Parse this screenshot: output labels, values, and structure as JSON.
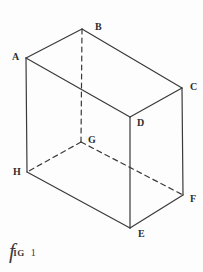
{
  "figure": {
    "caption": {
      "lead": "f",
      "small_caps": "IG",
      "number": "1",
      "full_text": "Fig 1"
    },
    "style": {
      "background_color": "#fdfdfd",
      "stroke_color": "#3a3a3a",
      "label_color": "#2e2e2e",
      "stroke_width": 1.2,
      "hidden_dash_pattern": "5 4"
    },
    "shape": {
      "name": "cuboid",
      "description": "Hand-drawn rectangular box in oblique projection with hidden edges dashed"
    },
    "vertices": [
      {
        "id": "A",
        "label": "A",
        "x": 26,
        "y": 58,
        "label_x": 12,
        "label_y": 52,
        "hidden": false
      },
      {
        "id": "B",
        "label": "B",
        "x": 82,
        "y": 29,
        "label_x": 95,
        "label_y": 22,
        "hidden": false
      },
      {
        "id": "C",
        "label": "C",
        "x": 182,
        "y": 88,
        "label_x": 190,
        "label_y": 82,
        "hidden": false
      },
      {
        "id": "D",
        "label": "D",
        "x": 130,
        "y": 117,
        "label_x": 137,
        "label_y": 118,
        "hidden": false
      },
      {
        "id": "G",
        "label": "G",
        "x": 81,
        "y": 142,
        "label_x": 88,
        "label_y": 135,
        "hidden": true
      },
      {
        "id": "H",
        "label": "H",
        "x": 27,
        "y": 172,
        "label_x": 13,
        "label_y": 167,
        "hidden": false
      },
      {
        "id": "F",
        "label": "F",
        "x": 183,
        "y": 195,
        "label_x": 190,
        "label_y": 194,
        "hidden": false
      },
      {
        "id": "E",
        "label": "E",
        "x": 130,
        "y": 228,
        "label_x": 138,
        "label_y": 229,
        "hidden": false
      }
    ],
    "edges": [
      {
        "id": "AB",
        "from": "A",
        "to": "B",
        "x1": 26,
        "y1": 58,
        "x2": 82,
        "y2": 29,
        "hidden": false
      },
      {
        "id": "BC",
        "from": "B",
        "to": "C",
        "x1": 82,
        "y1": 29,
        "x2": 182,
        "y2": 88,
        "hidden": false
      },
      {
        "id": "CD",
        "from": "C",
        "to": "D",
        "x1": 182,
        "y1": 88,
        "x2": 130,
        "y2": 117,
        "hidden": false
      },
      {
        "id": "DA",
        "from": "D",
        "to": "A",
        "x1": 130,
        "y1": 117,
        "x2": 26,
        "y2": 58,
        "hidden": false
      },
      {
        "id": "AH",
        "from": "A",
        "to": "H",
        "x1": 26,
        "y1": 58,
        "x2": 27,
        "y2": 172,
        "hidden": false
      },
      {
        "id": "DE",
        "from": "D",
        "to": "E",
        "x1": 130,
        "y1": 117,
        "x2": 130,
        "y2": 228,
        "hidden": false
      },
      {
        "id": "CF",
        "from": "C",
        "to": "F",
        "x1": 182,
        "y1": 88,
        "x2": 183,
        "y2": 195,
        "hidden": false
      },
      {
        "id": "HE",
        "from": "H",
        "to": "E",
        "x1": 27,
        "y1": 172,
        "x2": 130,
        "y2": 228,
        "hidden": false
      },
      {
        "id": "EF",
        "from": "E",
        "to": "F",
        "x1": 130,
        "y1": 228,
        "x2": 183,
        "y2": 195,
        "hidden": false
      },
      {
        "id": "BG",
        "from": "B",
        "to": "G",
        "x1": 82,
        "y1": 29,
        "x2": 81,
        "y2": 142,
        "hidden": true
      },
      {
        "id": "GH",
        "from": "G",
        "to": "H",
        "x1": 81,
        "y1": 142,
        "x2": 27,
        "y2": 172,
        "hidden": true
      },
      {
        "id": "GF",
        "from": "G",
        "to": "F",
        "x1": 81,
        "y1": 142,
        "x2": 183,
        "y2": 195,
        "hidden": true
      }
    ]
  }
}
